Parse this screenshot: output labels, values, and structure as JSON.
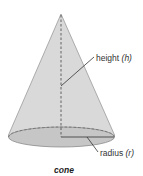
{
  "diagram": {
    "shape": "cone",
    "caption": "cone",
    "labels": {
      "height": {
        "text": "height",
        "var": "(h)"
      },
      "radius": {
        "text": "radius",
        "var": "(r)"
      }
    },
    "colors": {
      "body_fill": "#d6d6d6",
      "base_fill": "#c2c2c2",
      "outline": "#8a8a8a",
      "dashed": "#555555",
      "leader": "#333333"
    }
  }
}
